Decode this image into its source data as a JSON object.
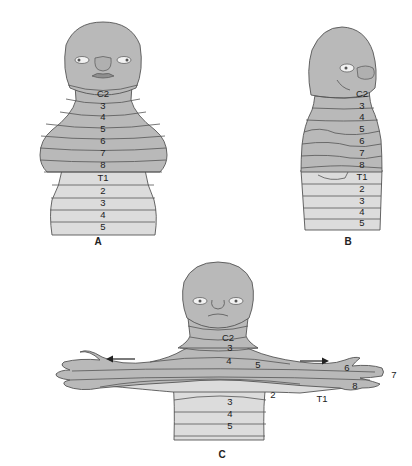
{
  "figure": {
    "colors": {
      "cervical_fill": "#b9b9b9",
      "thoracic_fill": "#dcdcdc",
      "outline": "#555555",
      "text": "#222222"
    },
    "panels": [
      {
        "caption": "A",
        "view": "front",
        "labels": [
          "C2",
          "3",
          "4",
          "5",
          "6",
          "7",
          "8",
          "T1",
          "2",
          "3",
          "4",
          "5"
        ]
      },
      {
        "caption": "B",
        "view": "side",
        "labels": [
          "C2",
          "3",
          "4",
          "5",
          "6",
          "7",
          "8",
          "T1",
          "2",
          "3",
          "4",
          "5"
        ]
      },
      {
        "caption": "C",
        "view": "arms extended",
        "labels": [
          "C2",
          "3",
          "4",
          "5",
          "6",
          "7",
          "8",
          "T1",
          "2",
          "3",
          "4",
          "5"
        ],
        "arrows": [
          "left-arrow",
          "right-arrow"
        ]
      }
    ]
  }
}
